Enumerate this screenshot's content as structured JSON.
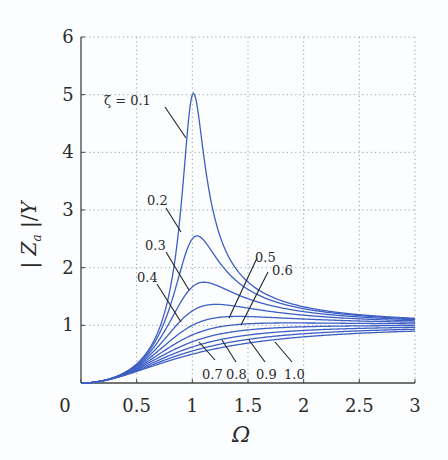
{
  "chart_data": {
    "type": "line",
    "title": "",
    "xlabel": "Ω",
    "ylabel": "|Z_a|/Y",
    "xlim": [
      0,
      3
    ],
    "ylim": [
      0,
      6
    ],
    "grid": true,
    "legend_position": "none (inline annotations)",
    "x_ticks": [
      "0",
      "0.5",
      "1",
      "1.5",
      "2",
      "2.5",
      "3"
    ],
    "y_ticks": [
      "1",
      "2",
      "3",
      "4",
      "5",
      "6"
    ],
    "line_color": "#3d5fc4",
    "x": [
      0,
      0.2,
      0.4,
      0.6,
      0.7,
      0.8,
      0.9,
      0.95,
      1.0,
      1.05,
      1.1,
      1.2,
      1.3,
      1.4,
      1.6,
      1.8,
      2.0,
      2.5,
      3.0
    ],
    "series": [
      {
        "name": "ζ = 0.1",
        "zeta": 0.1,
        "values": [
          0,
          0.04,
          0.19,
          0.55,
          0.93,
          1.62,
          3.1,
          4.23,
          5.0,
          4.72,
          3.98,
          2.87,
          2.29,
          1.96,
          1.61,
          1.43,
          1.32,
          1.19,
          1.12
        ]
      },
      {
        "name": "0.2",
        "zeta": 0.2,
        "values": [
          0,
          0.04,
          0.19,
          0.53,
          0.84,
          1.33,
          1.99,
          2.3,
          2.5,
          2.55,
          2.48,
          2.21,
          1.96,
          1.76,
          1.52,
          1.38,
          1.29,
          1.17,
          1.11
        ]
      },
      {
        "name": "0.3",
        "zeta": 0.3,
        "values": [
          0,
          0.04,
          0.18,
          0.49,
          0.74,
          1.07,
          1.42,
          1.56,
          1.67,
          1.73,
          1.75,
          1.71,
          1.62,
          1.54,
          1.4,
          1.3,
          1.24,
          1.14,
          1.1
        ]
      },
      {
        "name": "0.4",
        "zeta": 0.4,
        "values": [
          0,
          0.04,
          0.18,
          0.45,
          0.65,
          0.87,
          1.09,
          1.18,
          1.25,
          1.3,
          1.34,
          1.36,
          1.35,
          1.33,
          1.27,
          1.22,
          1.18,
          1.11,
          1.08
        ]
      },
      {
        "name": "0.5",
        "zeta": 0.5,
        "values": [
          0,
          0.04,
          0.17,
          0.41,
          0.57,
          0.73,
          0.88,
          0.94,
          1.0,
          1.05,
          1.08,
          1.13,
          1.15,
          1.15,
          1.15,
          1.13,
          1.11,
          1.07,
          1.05
        ]
      },
      {
        "name": "0.6",
        "zeta": 0.6,
        "values": [
          0,
          0.04,
          0.17,
          0.37,
          0.5,
          0.62,
          0.74,
          0.79,
          0.83,
          0.87,
          0.91,
          0.96,
          0.99,
          1.01,
          1.03,
          1.04,
          1.04,
          1.03,
          1.03
        ]
      },
      {
        "name": "0.7",
        "zeta": 0.7,
        "values": [
          0,
          0.04,
          0.16,
          0.34,
          0.44,
          0.54,
          0.64,
          0.68,
          0.71,
          0.75,
          0.78,
          0.83,
          0.87,
          0.9,
          0.94,
          0.96,
          0.97,
          0.99,
          1.0
        ]
      },
      {
        "name": "0.8",
        "zeta": 0.8,
        "values": [
          0,
          0.04,
          0.15,
          0.31,
          0.4,
          0.48,
          0.56,
          0.59,
          0.63,
          0.66,
          0.68,
          0.73,
          0.77,
          0.8,
          0.85,
          0.89,
          0.91,
          0.95,
          0.96
        ]
      },
      {
        "name": "0.9",
        "zeta": 0.9,
        "values": [
          0,
          0.04,
          0.14,
          0.29,
          0.36,
          0.43,
          0.5,
          0.53,
          0.56,
          0.58,
          0.61,
          0.65,
          0.69,
          0.73,
          0.78,
          0.82,
          0.85,
          0.9,
          0.93
        ]
      },
      {
        "name": "1.0",
        "zeta": 1.0,
        "values": [
          0,
          0.04,
          0.14,
          0.26,
          0.33,
          0.39,
          0.45,
          0.47,
          0.5,
          0.52,
          0.55,
          0.59,
          0.63,
          0.66,
          0.72,
          0.76,
          0.8,
          0.86,
          0.9
        ]
      }
    ],
    "annotations": [
      {
        "text": "ζ = 0.1",
        "label_px": [
          104,
          105
        ],
        "line_from_px": [
          165,
          107
        ],
        "line_to_px": [
          186,
          138
        ]
      },
      {
        "text": "0.2",
        "label_px": [
          147,
          205
        ],
        "line_from_px": [
          166,
          208
        ],
        "line_to_px": [
          181,
          232
        ]
      },
      {
        "text": "0.3",
        "label_px": [
          145,
          250
        ],
        "line_from_px": [
          166,
          252
        ],
        "line_to_px": [
          189,
          290
        ]
      },
      {
        "text": "0.4",
        "label_px": [
          137,
          282
        ],
        "line_from_px": [
          157,
          284
        ],
        "line_to_px": [
          181,
          322
        ]
      },
      {
        "text": "0.5",
        "label_px": [
          255,
          262
        ],
        "line_from_px": [
          257,
          258
        ],
        "line_to_px": [
          229,
          318
        ]
      },
      {
        "text": "0.6",
        "label_px": [
          272,
          275
        ],
        "line_from_px": [
          268,
          272
        ],
        "line_to_px": [
          241,
          325
        ]
      },
      {
        "text": "0.7",
        "label_px": [
          202,
          379
        ],
        "line_from_px": [
          215,
          360
        ],
        "line_to_px": [
          199,
          342
        ]
      },
      {
        "text": "0.8",
        "label_px": [
          226,
          379
        ],
        "line_from_px": [
          236,
          362
        ],
        "line_to_px": [
          222,
          340
        ]
      },
      {
        "text": "0.9",
        "label_px": [
          256,
          379
        ],
        "line_from_px": [
          265,
          362
        ],
        "line_to_px": [
          249,
          340
        ]
      },
      {
        "text": "1.0",
        "label_px": [
          284,
          379
        ],
        "line_from_px": [
          292,
          362
        ],
        "line_to_px": [
          275,
          342
        ]
      }
    ]
  }
}
